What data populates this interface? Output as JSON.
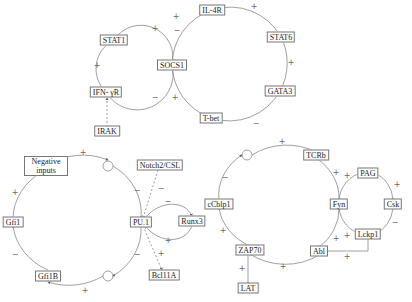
{
  "colors": {
    "line": "#888888",
    "node_border": "#777777",
    "text": "#222222",
    "sign": "#666666"
  },
  "panels": [
    {
      "id": "top",
      "nodes": [
        {
          "id": "STAT1",
          "label": "STAT1",
          "x": 114,
          "y": 40
        },
        {
          "id": "SOCS1",
          "label": "SOCS1",
          "x": 172,
          "y": 65
        },
        {
          "id": "IL4R",
          "label": "IL-4R",
          "x": 212,
          "y": 10
        },
        {
          "id": "STAT6",
          "label": "STAT6",
          "x": 281,
          "y": 37
        },
        {
          "id": "GATA3",
          "label": "GATA3",
          "x": 280,
          "y": 91
        },
        {
          "id": "Tbet",
          "label": "T-bet",
          "x": 211,
          "y": 118
        },
        {
          "id": "IFNgR",
          "label": "IFN- γR",
          "x": 106,
          "y": 92
        },
        {
          "id": "IRAK",
          "label": "IRAK",
          "x": 107,
          "y": 131
        }
      ],
      "signs": [
        {
          "t": "+",
          "x": 155,
          "y": 28
        },
        {
          "t": "+",
          "x": 97,
          "y": 65
        },
        {
          "t": "−",
          "x": 155,
          "y": 97
        },
        {
          "t": "+",
          "x": 175,
          "y": 97
        },
        {
          "t": "−",
          "x": 177,
          "y": 30
        },
        {
          "t": "+",
          "x": 254,
          "y": 6
        },
        {
          "t": "+",
          "x": 291,
          "y": 62
        },
        {
          "t": "−",
          "x": 256,
          "y": 123
        },
        {
          "t": "+",
          "x": 176,
          "y": 16
        }
      ]
    },
    {
      "id": "bottom_left",
      "nodes": [
        {
          "id": "NegInputs",
          "label": "Negative inputs",
          "x": 46,
          "y": 166,
          "multi": true
        },
        {
          "id": "Gfi1",
          "label": "Gfi1",
          "x": 13,
          "y": 222
        },
        {
          "id": "Gfi1B",
          "label": "Gfi1B",
          "x": 48,
          "y": 276
        },
        {
          "id": "PU1",
          "label": "PU.1",
          "x": 141,
          "y": 222
        },
        {
          "id": "Notch",
          "label": "Notch2/CSL",
          "x": 160,
          "y": 165
        },
        {
          "id": "Runx3",
          "label": "Runx3",
          "x": 192,
          "y": 221
        },
        {
          "id": "Bcl11A",
          "label": "Bcl11A",
          "x": 164,
          "y": 275
        }
      ],
      "signs": [
        {
          "t": "+",
          "x": 83,
          "y": 152
        },
        {
          "t": "+",
          "x": 15,
          "y": 192
        },
        {
          "t": "−",
          "x": 15,
          "y": 254
        },
        {
          "t": "+",
          "x": 85,
          "y": 290
        },
        {
          "t": "−",
          "x": 137,
          "y": 190
        },
        {
          "t": "−",
          "x": 137,
          "y": 254
        },
        {
          "t": "−",
          "x": 161,
          "y": 188
        },
        {
          "t": "−",
          "x": 168,
          "y": 201
        },
        {
          "t": "+",
          "x": 168,
          "y": 240
        },
        {
          "t": "+",
          "x": 161,
          "y": 253
        }
      ],
      "circles": [
        {
          "x": 108,
          "y": 166
        },
        {
          "x": 108,
          "y": 276
        }
      ]
    },
    {
      "id": "bottom_right",
      "nodes": [
        {
          "id": "cCblp1",
          "label": "cCblp1",
          "x": 219,
          "y": 204
        },
        {
          "id": "TCRb",
          "label": "TCRb",
          "x": 316,
          "y": 155
        },
        {
          "id": "Fyn",
          "label": "Fyn",
          "x": 339,
          "y": 204
        },
        {
          "id": "PAG",
          "label": "PAG",
          "x": 368,
          "y": 173
        },
        {
          "id": "Csk",
          "label": "Csk",
          "x": 393,
          "y": 204
        },
        {
          "id": "Lckp1",
          "label": "Lckp1",
          "x": 368,
          "y": 234
        },
        {
          "id": "Abl",
          "label": "Abl",
          "x": 319,
          "y": 251
        },
        {
          "id": "ZAP70",
          "label": "ZAP70",
          "x": 250,
          "y": 250
        },
        {
          "id": "LAT",
          "label": "LAT",
          "x": 248,
          "y": 288
        }
      ],
      "signs": [
        {
          "t": "+",
          "x": 282,
          "y": 141
        },
        {
          "t": "−",
          "x": 225,
          "y": 177
        },
        {
          "t": "+",
          "x": 223,
          "y": 230
        },
        {
          "t": "+",
          "x": 283,
          "y": 266
        },
        {
          "t": "+",
          "x": 336,
          "y": 172
        },
        {
          "t": "+",
          "x": 347,
          "y": 175
        },
        {
          "t": "+",
          "x": 397,
          "y": 184
        },
        {
          "t": "−",
          "x": 395,
          "y": 222
        },
        {
          "t": "+",
          "x": 347,
          "y": 235
        },
        {
          "t": "+",
          "x": 336,
          "y": 238
        },
        {
          "t": "+",
          "x": 347,
          "y": 256
        },
        {
          "t": "+",
          "x": 242,
          "y": 268
        }
      ],
      "circles": [
        {
          "x": 247,
          "y": 155
        }
      ]
    }
  ]
}
